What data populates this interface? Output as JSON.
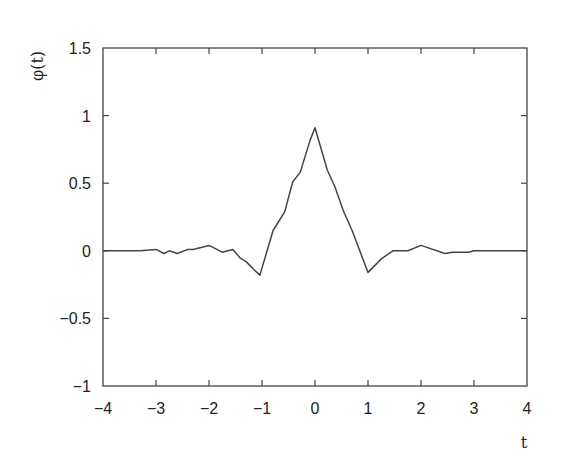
{
  "chart_data": {
    "type": "line",
    "title": "",
    "xlabel": "t",
    "ylabel": "φ(t)",
    "xlim": [
      -4,
      4
    ],
    "ylim": [
      -1,
      1.5
    ],
    "grid": false,
    "legend": null,
    "xticks": [
      -4,
      -3,
      -2,
      -1,
      0,
      1,
      2,
      3,
      4
    ],
    "xtick_labels": [
      "−4",
      "−3",
      "−2",
      "−1",
      "0",
      "1",
      "2",
      "3",
      "4"
    ],
    "yticks": [
      -1,
      -0.5,
      0,
      0.5,
      1,
      1.5
    ],
    "ytick_labels": [
      "−1",
      "−0.5",
      "0",
      "0.5",
      "1",
      "1.5"
    ],
    "line_color": "#444444",
    "series": [
      {
        "name": "φ(t)",
        "x": [
          -4.0,
          -3.5,
          -3.3,
          -3.0,
          -2.85,
          -2.75,
          -2.6,
          -2.4,
          -2.3,
          -2.0,
          -1.75,
          -1.55,
          -1.42,
          -1.3,
          -1.15,
          -1.04,
          -0.79,
          -0.57,
          -0.42,
          -0.28,
          -0.09,
          -0.03,
          0.0,
          0.23,
          0.38,
          0.53,
          0.7,
          1.0,
          1.25,
          1.47,
          1.75,
          2.0,
          2.45,
          2.6,
          2.9,
          3.0,
          3.5,
          4.0
        ],
        "y": [
          0.0,
          0.0,
          0.0,
          0.01,
          -0.02,
          0.0,
          -0.02,
          0.01,
          0.01,
          0.04,
          -0.01,
          0.01,
          -0.05,
          -0.08,
          -0.14,
          -0.18,
          0.15,
          0.29,
          0.51,
          0.58,
          0.82,
          0.88,
          0.91,
          0.6,
          0.47,
          0.3,
          0.15,
          -0.16,
          -0.06,
          0.0,
          0.0,
          0.04,
          -0.02,
          -0.01,
          -0.01,
          0.0,
          0.0,
          0.0
        ]
      }
    ]
  }
}
